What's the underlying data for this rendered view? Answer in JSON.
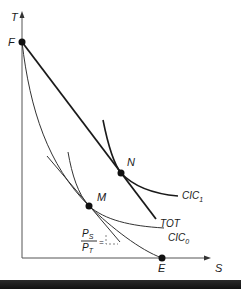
{
  "diagram": {
    "axes": {
      "y_label": "T",
      "x_label": "S"
    },
    "points": {
      "F": "F",
      "N": "N",
      "M": "M",
      "E": "E"
    },
    "curves": {
      "tot": "TOT",
      "cic1_base": "CIC",
      "cic1_sub": "1",
      "cic0_base": "CIC",
      "cic0_sub": "0"
    },
    "price_ratio": {
      "numerator_base": "P",
      "numerator_sub": "S",
      "denominator_base": "P",
      "denominator_sub": "T",
      "relation": "="
    },
    "colors": {
      "line": "#1a1a1a",
      "thin_line": "#333333",
      "background": "#ffffff"
    }
  }
}
